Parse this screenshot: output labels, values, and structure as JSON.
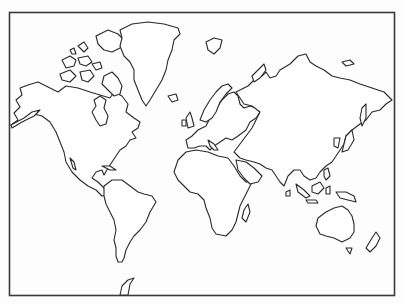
{
  "map": {
    "type": "world-outline-map",
    "projection": "mercator-like",
    "style": {
      "stroke": "#2a2a2a",
      "fill": "#ffffff",
      "background": "#fdfdfd",
      "frame": "#3a3a3a"
    },
    "labels_visible": false,
    "landmasses": [
      "North America",
      "Greenland",
      "Canadian Arctic Archipelago",
      "Iceland",
      "South America",
      "Antarctic Peninsula",
      "Europe",
      "Great Britain",
      "Scandinavia",
      "Svalbard",
      "Africa",
      "Madagascar",
      "Arabian Peninsula",
      "Asia",
      "Novaya Zemlya",
      "Japan",
      "Sakhalin",
      "Indonesia",
      "New Guinea",
      "Australia",
      "Tasmania",
      "New Zealand",
      "Cuba",
      "Sri Lanka",
      "Philippines"
    ]
  }
}
